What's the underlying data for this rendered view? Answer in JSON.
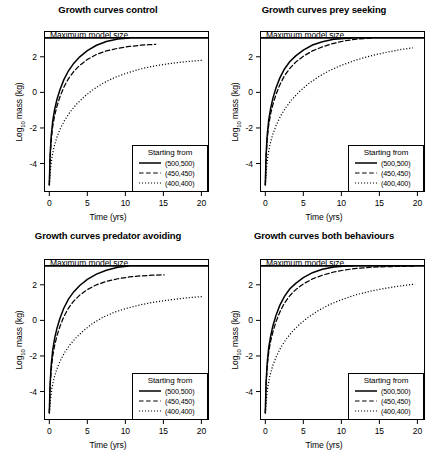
{
  "figure": {
    "width": 432,
    "height": 453,
    "background": "#ffffff",
    "foreground": "#000000"
  },
  "chart_data": [
    {
      "type": "line",
      "title": "Growth curves control",
      "xlabel": "Time (yrs)",
      "ylabel": "Log10 mass (kg)",
      "ylabel_base": "Log",
      "ylabel_sub": "10",
      "ylabel_rest": " mass (kg)",
      "xlim": [
        -0.7,
        21.0
      ],
      "ylim": [
        -5.6,
        3.45
      ],
      "xticks": [
        0,
        5,
        10,
        15,
        20
      ],
      "yticks": [
        2,
        0,
        -2,
        -4
      ],
      "grid": false,
      "annotation": "Maximum model size",
      "asymptote": 3.05,
      "legend_title": "Starting from",
      "legend_position": "bottom-right",
      "series": [
        {
          "name": "(500,500)",
          "style": "solid",
          "x": [
            0.0,
            0.1,
            0.25,
            0.45,
            0.7,
            1.0,
            1.4,
            1.9,
            2.5,
            3.2,
            4.0,
            5.0,
            6.2,
            7.5,
            9.0,
            10.5
          ],
          "values": [
            -5.2,
            -3.55,
            -2.45,
            -1.6,
            -0.95,
            -0.4,
            0.15,
            0.7,
            1.2,
            1.63,
            2.0,
            2.35,
            2.65,
            2.86,
            3.0,
            3.05
          ]
        },
        {
          "name": "(450,450)",
          "style": "dashed",
          "x": [
            0.0,
            0.1,
            0.25,
            0.45,
            0.7,
            1.0,
            1.4,
            1.9,
            2.5,
            3.2,
            4.0,
            5.0,
            6.2,
            7.5,
            9.0,
            10.5,
            12.0,
            13.0,
            14.0
          ],
          "values": [
            -5.2,
            -3.7,
            -2.7,
            -1.9,
            -1.3,
            -0.78,
            -0.25,
            0.28,
            0.76,
            1.17,
            1.52,
            1.85,
            2.13,
            2.33,
            2.48,
            2.58,
            2.65,
            2.68,
            2.7
          ]
        },
        {
          "name": "(400,400)",
          "style": "dotted",
          "x": [
            0.0,
            0.15,
            0.35,
            0.6,
            0.95,
            1.4,
            2.0,
            2.7,
            3.5,
            4.5,
            5.6,
            7.0,
            8.5,
            10.0,
            12.0,
            14.0,
            16.0,
            18.0,
            20.2
          ],
          "values": [
            -5.2,
            -4.35,
            -3.65,
            -3.1,
            -2.58,
            -2.08,
            -1.58,
            -1.12,
            -0.7,
            -0.28,
            0.11,
            0.5,
            0.82,
            1.06,
            1.32,
            1.5,
            1.63,
            1.73,
            1.81
          ]
        }
      ]
    },
    {
      "type": "line",
      "title": "Growth curves prey seeking",
      "xlabel": "Time (yrs)",
      "ylabel": "Log10 mass (kg)",
      "ylabel_base": "Log",
      "ylabel_sub": "10",
      "ylabel_rest": " mass (kg)",
      "xlim": [
        -0.7,
        21.0
      ],
      "ylim": [
        -5.6,
        3.45
      ],
      "xticks": [
        0,
        5,
        10,
        15,
        20
      ],
      "yticks": [
        2,
        0,
        -2,
        -4
      ],
      "grid": false,
      "annotation": "Maximum model size",
      "asymptote": 3.05,
      "legend_title": "Starting from",
      "legend_position": "bottom-right",
      "series": [
        {
          "name": "(500,500)",
          "style": "solid",
          "x": [
            0.0,
            0.1,
            0.25,
            0.45,
            0.7,
            1.0,
            1.4,
            1.9,
            2.5,
            3.2,
            4.0,
            5.0,
            6.2,
            7.5,
            9.0,
            10.4,
            11.4
          ],
          "values": [
            -5.2,
            -3.5,
            -2.4,
            -1.55,
            -0.9,
            -0.32,
            0.25,
            0.8,
            1.3,
            1.72,
            2.05,
            2.38,
            2.66,
            2.85,
            2.98,
            3.03,
            3.05
          ]
        },
        {
          "name": "(450,450)",
          "style": "dashed",
          "x": [
            0.0,
            0.1,
            0.25,
            0.45,
            0.7,
            1.0,
            1.4,
            1.9,
            2.5,
            3.2,
            4.0,
            5.0,
            6.2,
            7.5,
            9.0,
            10.5,
            12.0,
            13.2,
            14.2
          ],
          "values": [
            -5.2,
            -3.65,
            -2.62,
            -1.82,
            -1.2,
            -0.68,
            -0.12,
            0.42,
            0.92,
            1.34,
            1.7,
            2.03,
            2.33,
            2.56,
            2.76,
            2.9,
            2.99,
            3.03,
            3.05
          ]
        },
        {
          "name": "(400,400)",
          "style": "dotted",
          "x": [
            0.0,
            0.15,
            0.35,
            0.6,
            0.95,
            1.4,
            2.0,
            2.7,
            3.5,
            4.5,
            5.6,
            7.0,
            8.5,
            10.0,
            12.0,
            14.0,
            16.0,
            18.0,
            19.4
          ],
          "values": [
            -5.2,
            -4.25,
            -3.52,
            -2.95,
            -2.4,
            -1.88,
            -1.33,
            -0.85,
            -0.4,
            0.05,
            0.46,
            0.88,
            1.24,
            1.52,
            1.83,
            2.07,
            2.26,
            2.42,
            2.5
          ]
        }
      ]
    },
    {
      "type": "line",
      "title": "Growth curves predator avoiding",
      "xlabel": "Time (yrs)",
      "ylabel": "Log10 mass (kg)",
      "ylabel_base": "Log",
      "ylabel_sub": "10",
      "ylabel_rest": " mass (kg)",
      "xlim": [
        -0.7,
        21.0
      ],
      "ylim": [
        -5.6,
        3.45
      ],
      "xticks": [
        0,
        5,
        10,
        15,
        20
      ],
      "yticks": [
        2,
        0,
        -2,
        -4
      ],
      "grid": false,
      "annotation": "Maximum model size",
      "asymptote": 3.05,
      "legend_title": "Starting from",
      "legend_position": "bottom-right",
      "series": [
        {
          "name": "(500,500)",
          "style": "solid",
          "x": [
            0.0,
            0.1,
            0.25,
            0.45,
            0.7,
            1.0,
            1.4,
            1.9,
            2.5,
            3.2,
            4.0,
            5.0,
            6.2,
            7.5,
            9.0,
            10.4
          ],
          "values": [
            -5.2,
            -3.6,
            -2.5,
            -1.65,
            -1.0,
            -0.45,
            0.12,
            0.68,
            1.18,
            1.6,
            1.96,
            2.3,
            2.6,
            2.82,
            2.98,
            3.06
          ]
        },
        {
          "name": "(450,450)",
          "style": "dashed",
          "x": [
            0.0,
            0.1,
            0.25,
            0.45,
            0.7,
            1.0,
            1.4,
            1.9,
            2.5,
            3.2,
            4.0,
            5.0,
            6.2,
            7.5,
            9.0,
            10.5,
            12.0,
            13.5,
            15.1
          ],
          "values": [
            -5.2,
            -3.75,
            -2.78,
            -2.0,
            -1.4,
            -0.88,
            -0.33,
            0.2,
            0.68,
            1.08,
            1.42,
            1.73,
            2.0,
            2.19,
            2.34,
            2.44,
            2.5,
            2.54,
            2.56
          ]
        },
        {
          "name": "(400,400)",
          "style": "dotted",
          "x": [
            0.0,
            0.15,
            0.35,
            0.6,
            0.95,
            1.4,
            2.0,
            2.7,
            3.5,
            4.5,
            5.6,
            7.0,
            8.5,
            10.0,
            12.0,
            14.0,
            16.0,
            18.0,
            20.2
          ],
          "values": [
            -5.2,
            -4.45,
            -3.8,
            -3.28,
            -2.78,
            -2.3,
            -1.82,
            -1.38,
            -0.98,
            -0.58,
            -0.2,
            0.16,
            0.45,
            0.66,
            0.88,
            1.04,
            1.16,
            1.26,
            1.34
          ]
        }
      ]
    },
    {
      "type": "line",
      "title": "Growth curves both behaviours",
      "xlabel": "Time (yrs)",
      "ylabel": "Log10 mass (kg)",
      "ylabel_base": "Log",
      "ylabel_sub": "10",
      "ylabel_rest": " mass (kg)",
      "xlim": [
        -0.7,
        21.0
      ],
      "ylim": [
        -5.6,
        3.45
      ],
      "xticks": [
        0,
        5,
        10,
        15,
        20
      ],
      "yticks": [
        2,
        0,
        -2,
        -4
      ],
      "grid": false,
      "annotation": "Maximum model size",
      "asymptote": 3.05,
      "legend_title": "Starting from",
      "legend_position": "bottom-right",
      "series": [
        {
          "name": "(500,500)",
          "style": "solid",
          "x": [
            0.0,
            0.1,
            0.25,
            0.45,
            0.7,
            1.0,
            1.4,
            1.9,
            2.5,
            3.2,
            4.0,
            5.0,
            6.2,
            7.5,
            9.0,
            10.6,
            11.6
          ],
          "values": [
            -5.2,
            -3.48,
            -2.38,
            -1.52,
            -0.88,
            -0.3,
            0.28,
            0.84,
            1.34,
            1.76,
            2.08,
            2.4,
            2.68,
            2.87,
            3.0,
            3.05,
            3.07
          ]
        },
        {
          "name": "(450,450)",
          "style": "dashed",
          "x": [
            0.0,
            0.1,
            0.25,
            0.45,
            0.7,
            1.0,
            1.4,
            1.9,
            2.5,
            3.2,
            4.0,
            5.0,
            6.2,
            7.5,
            9.0,
            10.5,
            12.0,
            14.0,
            16.0,
            18.0,
            19.6
          ],
          "values": [
            -5.2,
            -3.62,
            -2.58,
            -1.78,
            -1.16,
            -0.64,
            -0.08,
            0.46,
            0.96,
            1.38,
            1.73,
            2.05,
            2.33,
            2.54,
            2.72,
            2.84,
            2.92,
            2.99,
            3.02,
            3.04,
            3.05
          ]
        },
        {
          "name": "(400,400)",
          "style": "dotted",
          "x": [
            0.0,
            0.15,
            0.35,
            0.6,
            0.95,
            1.4,
            2.0,
            2.7,
            3.5,
            4.5,
            5.6,
            7.0,
            8.5,
            10.0,
            12.0,
            14.0,
            16.0,
            18.0,
            19.7
          ],
          "values": [
            -5.2,
            -4.38,
            -3.68,
            -3.12,
            -2.58,
            -2.08,
            -1.55,
            -1.08,
            -0.65,
            -0.22,
            0.16,
            0.56,
            0.9,
            1.16,
            1.45,
            1.66,
            1.82,
            1.95,
            2.04
          ]
        }
      ]
    }
  ]
}
